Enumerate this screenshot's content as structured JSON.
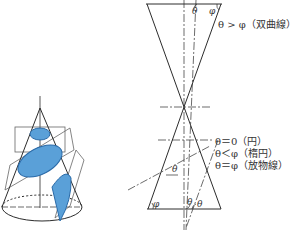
{
  "diagram": {
    "left_figure": {
      "description": "cone cut by planes",
      "fill_color": "#5aa0d8",
      "stroke_color": "#2c2c2c",
      "sections": [
        "circle",
        "ellipse",
        "parabola"
      ]
    },
    "right_figure": {
      "description": "double cone cross-section with cutting lines",
      "top_labels": {
        "theta": "θ",
        "phi": "φ"
      },
      "hyperbola_label": "θ > φ（双曲線）",
      "conditions": [
        "θ＝0（円）",
        "θ＜φ（楕円）",
        "θ＝φ（放物線）"
      ],
      "bottom_labels": {
        "phi": "φ",
        "theta1": "θ",
        "theta2": "θ"
      },
      "middle_label": "θ"
    }
  }
}
